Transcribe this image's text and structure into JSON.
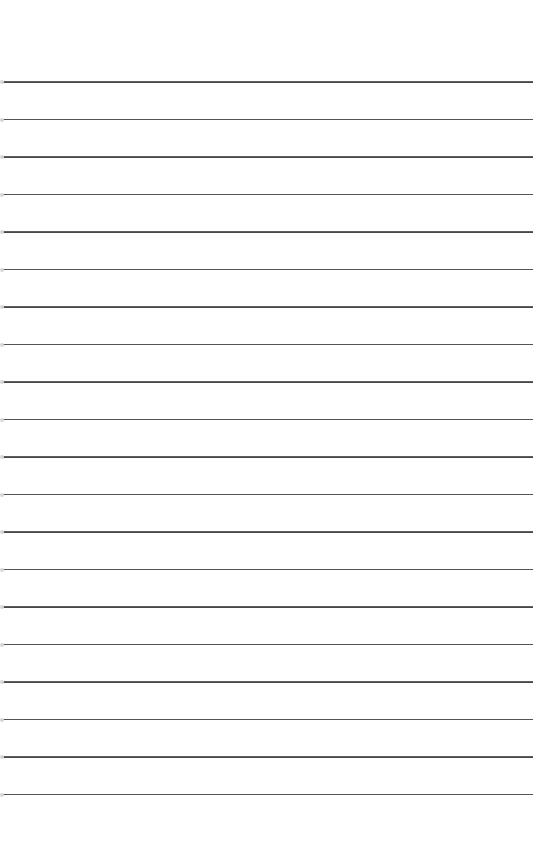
{
  "page": {
    "type": "lined-paper",
    "background": "#ffffff",
    "line_color": "#4a4a4a",
    "line_count": 20,
    "first_line_y": 81,
    "line_spacing": 37.5,
    "lines": [
      81,
      118.5,
      156,
      193.5,
      231,
      268.5,
      306,
      343.5,
      381,
      418.5,
      456,
      493.5,
      531,
      568.5,
      606,
      643.5,
      681,
      718.5,
      756,
      793.5
    ]
  }
}
